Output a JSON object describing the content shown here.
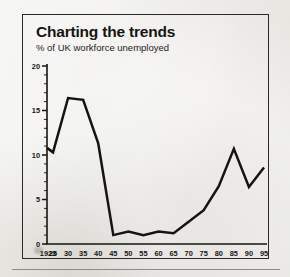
{
  "chart_data": {
    "type": "line",
    "title": "Charting the trends",
    "subtitle": "% of UK workforce unemployed",
    "xlabel": "",
    "ylabel": "",
    "ylim": [
      0,
      20
    ],
    "yticks": [
      "0",
      "5",
      "10",
      "15",
      "20"
    ],
    "ytick_values": [
      0,
      5,
      10,
      15,
      20
    ],
    "grid": false,
    "legend": "none",
    "x": [
      1923,
      1925,
      1930,
      1935,
      1940,
      1945,
      1950,
      1955,
      1960,
      1965,
      1970,
      1975,
      1980,
      1985,
      1990,
      1995
    ],
    "xtick_labels": [
      "1923",
      "25",
      "30",
      "35",
      "40",
      "45",
      "50",
      "55",
      "60",
      "65",
      "70",
      "75",
      "80",
      "85",
      "90",
      "95"
    ],
    "series": [
      {
        "name": "% of UK workforce unemployed",
        "color": "#15140f",
        "values": [
          10.8,
          10.3,
          16.4,
          16.2,
          11.3,
          1.0,
          1.4,
          1.0,
          1.4,
          1.2,
          2.5,
          3.8,
          6.5,
          10.7,
          6.4,
          8.6
        ]
      }
    ]
  }
}
